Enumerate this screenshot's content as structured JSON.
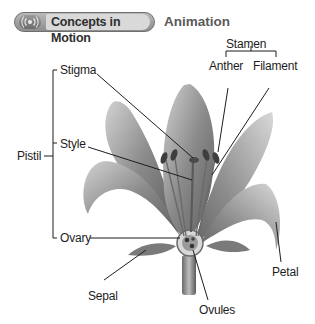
{
  "header": {
    "badge_label": "Concepts in Motion",
    "badge_icon": "motion-rings-icon",
    "section_label": "Animation"
  },
  "diagram": {
    "labels": {
      "stamen": "Stamen",
      "anther": "Anther",
      "filament": "Filament",
      "stigma": "Stigma",
      "style": "Style",
      "pistil": "Pistil",
      "ovary": "Ovary",
      "sepal": "Sepal",
      "ovules": "Ovules",
      "petal": "Petal"
    },
    "colors": {
      "ink": "#1d1d1d",
      "petal_dark": "#6e6e6e",
      "petal_light": "#cfcfcf",
      "badge": "#9a9a9a"
    }
  }
}
